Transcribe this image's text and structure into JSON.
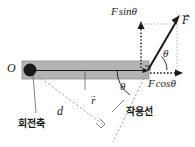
{
  "figure": {
    "colors": {
      "bar_fill": "#b4b4b4",
      "bar_stroke": "#7a7a7a",
      "pivot_fill": "#1a1a1a",
      "vector_stroke": "#1a1a1a",
      "dashed_stroke": "#8c8c8c",
      "text": "#1a1a1a",
      "background": "#ffffff"
    },
    "labels": {
      "origin": "O",
      "pivot_ko": "회전축",
      "r_vector": "r",
      "distance": "d",
      "line_of_action_ko": "작용선",
      "force": "F",
      "force_sin": "F sinθ",
      "force_sin_parts": {
        "f": "F",
        "fn": "sin",
        "angle": "θ"
      },
      "force_cos": "F cosθ",
      "force_cos_parts": {
        "f": "F",
        "fn": "cos",
        "angle": "θ"
      },
      "angle_upper": "θ",
      "angle_lower": "θ"
    }
  }
}
